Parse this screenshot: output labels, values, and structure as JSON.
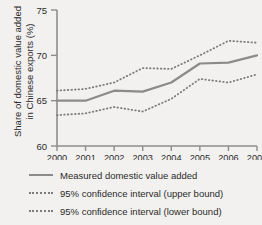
{
  "chart_data": {
    "type": "line",
    "title": "",
    "xlabel": "",
    "ylabel": "Share of domestic value added in Chinese exports (%)",
    "categories": [
      "2000",
      "2001",
      "2002",
      "2003",
      "2004",
      "2005",
      "2006",
      "2007"
    ],
    "x": [
      2000,
      2001,
      2002,
      2003,
      2004,
      2005,
      2006,
      2007
    ],
    "xlim": [
      2000,
      2007
    ],
    "ylim": [
      60,
      75
    ],
    "yticks": [
      60,
      65,
      70,
      75
    ],
    "grid": false,
    "legend_position": "below",
    "series": [
      {
        "name": "Measured domestic value added",
        "style": "solid",
        "color": "#8b8b8b",
        "values": [
          65.0,
          65.0,
          66.1,
          66.0,
          67.0,
          69.1,
          69.2,
          70.0
        ]
      },
      {
        "name": "95% confidence interval (upper bound)",
        "style": "dotted",
        "color": "#7d7d7d",
        "values": [
          66.1,
          66.3,
          67.0,
          68.6,
          68.5,
          70.0,
          71.6,
          71.4
        ]
      },
      {
        "name": "95% confidence interval (lower bound)",
        "style": "dotted",
        "color": "#7d7d7d",
        "values": [
          63.4,
          63.6,
          64.3,
          63.8,
          65.2,
          67.4,
          67.0,
          67.9
        ]
      }
    ]
  },
  "axis": {
    "y_title": "Share of domestic value added in Chinese exports (%)",
    "y_tick_labels": [
      "75",
      "70",
      "65",
      "60"
    ],
    "x_tick_labels": [
      "2000",
      "2001",
      "2002",
      "2003",
      "2004",
      "2005",
      "2006",
      "2007"
    ]
  },
  "legend": {
    "items": [
      {
        "label": "Measured domestic value added",
        "style": "solid"
      },
      {
        "label": "95% confidence interval (upper bound)",
        "style": "dotted"
      },
      {
        "label": "95% confidence interval (lower bound)",
        "style": "dotted"
      }
    ]
  },
  "colors": {
    "background": "#f2f1ef",
    "axis": "#8d8d8d",
    "series_main": "#8b8b8b",
    "series_bounds": "#7d7d7d",
    "text": "#2b2b2b"
  }
}
